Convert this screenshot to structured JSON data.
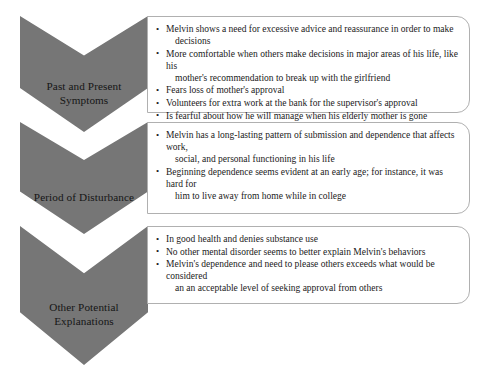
{
  "diagram": {
    "type": "chevron-process-list",
    "accent_color": "#767676",
    "box_border_color": "#b0b0b0",
    "background_color": "#ffffff",
    "text_color": "#1a1a1a",
    "sections": [
      {
        "label_line1": "Past and Present",
        "label_line2": "Symptoms",
        "bullets": [
          {
            "line1": "Melvin shows a need for excessive advice and reassurance in order to make",
            "line2": "decisions"
          },
          {
            "line1": "More comfortable when others make decisions in major areas of his life, like his",
            "line2": "mother's recommendation to break up with the girlfriend"
          },
          {
            "line1": "Fears loss of mother's approval",
            "line2": ""
          },
          {
            "line1": "Volunteers for extra work at the bank for the supervisor's approval",
            "line2": ""
          },
          {
            "line1": "Is fearful about how he will manage when his elderly mother is gone",
            "line2": ""
          }
        ]
      },
      {
        "label_line1": "Period of Disturbance",
        "label_line2": "",
        "bullets": [
          {
            "line1": "Melvin has a long-lasting pattern of submission and dependence that affects work,",
            "line2": "social, and personal functioning in his life"
          },
          {
            "line1": "Beginning dependence seems evident at an early age; for instance, it was hard for",
            "line2": "him to live away from home while in college"
          }
        ]
      },
      {
        "label_line1": "Other Potential",
        "label_line2": "Explanations",
        "bullets": [
          {
            "line1": "In good health and denies substance use",
            "line2": ""
          },
          {
            "line1": "No other mental disorder seems to better explain Melvin's behaviors",
            "line2": ""
          },
          {
            "line1": "Melvin's dependence and need to please others exceeds what would be considered",
            "line2": "an an acceptable level of seeking approval from others"
          }
        ]
      }
    ]
  }
}
